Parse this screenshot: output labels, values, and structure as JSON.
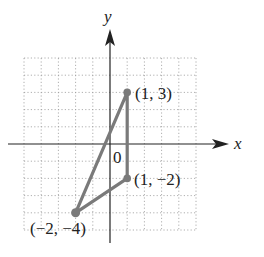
{
  "diagram": {
    "type": "coordinate-plane-triangle",
    "axes": {
      "x_label": "x",
      "y_label": "y",
      "origin_label": "0"
    },
    "grid": {
      "x_range": [
        -5,
        5
      ],
      "y_range": [
        -5,
        5
      ],
      "step": 1,
      "style": "dotted"
    },
    "vertices": [
      {
        "x": 1,
        "y": 3,
        "label": "(1, 3)"
      },
      {
        "x": 1,
        "y": -2,
        "label": "(1, −2)"
      },
      {
        "x": -2,
        "y": -4,
        "label": "(−2, −4)"
      }
    ],
    "colors": {
      "triangle": "#7a7a7a",
      "axes": "#222222",
      "grid": "#9a9a9a"
    }
  }
}
